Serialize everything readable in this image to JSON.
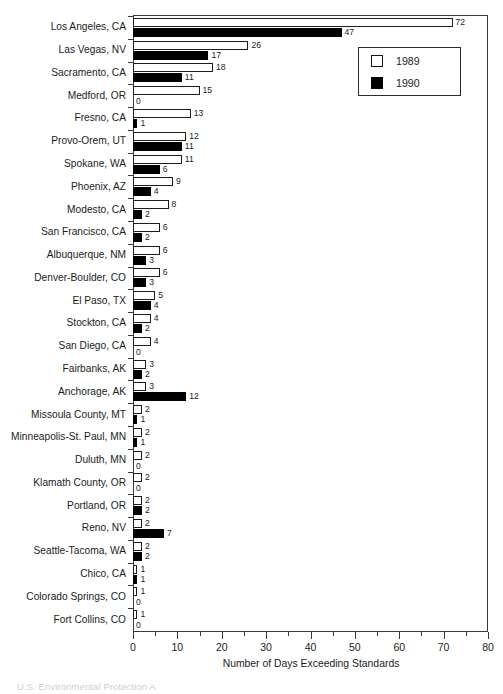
{
  "chart_data": {
    "type": "bar",
    "orientation": "horizontal",
    "title": "",
    "xlabel": "Number of Days Exceeding Standards",
    "ylabel": "",
    "xlim": [
      0,
      80
    ],
    "xticks": [
      0,
      10,
      20,
      30,
      40,
      50,
      60,
      70,
      80
    ],
    "xtick_labels": [
      "0",
      "10",
      "20",
      "30",
      "40",
      "50",
      "60",
      "70",
      "80"
    ],
    "minor_tick_step": 5,
    "grid": false,
    "legend_position": "top-right",
    "categories": [
      "Los Angeles, CA",
      "Las Vegas, NV",
      "Sacramento, CA",
      "Medford, OR",
      "Fresno, CA",
      "Provo-Orem, UT",
      "Spokane, WA",
      "Phoenix, AZ",
      "Modesto, CA",
      "San Francisco, CA",
      "Albuquerque, NM",
      "Denver-Boulder, CO",
      "El Paso, TX",
      "Stockton, CA",
      "San Diego, CA",
      "Fairbanks, AK",
      "Anchorage, AK",
      "Missoula County, MT",
      "Minneapolis-St. Paul, MN",
      "Duluth, MN",
      "Klamath County, OR",
      "Portland, OR",
      "Reno, NV",
      "Seattle-Tacoma, WA",
      "Chico, CA",
      "Colorado Springs, CO",
      "Fort Collins, CO"
    ],
    "series": [
      {
        "name": "1989",
        "style": "open",
        "color": "#ffffff",
        "edge_color": "#1c1c1c",
        "values": [
          72,
          26,
          18,
          15,
          13,
          12,
          11,
          9,
          8,
          6,
          6,
          6,
          5,
          4,
          4,
          3,
          3,
          2,
          2,
          2,
          2,
          2,
          2,
          2,
          1,
          1,
          1
        ]
      },
      {
        "name": "1990",
        "style": "solid",
        "color": "#000000",
        "edge_color": "#000000",
        "values": [
          47,
          17,
          11,
          0,
          1,
          11,
          6,
          4,
          2,
          2,
          3,
          3,
          4,
          2,
          0,
          2,
          12,
          1,
          1,
          0,
          0,
          2,
          7,
          2,
          1,
          0,
          0
        ]
      }
    ]
  },
  "legend": {
    "items": [
      {
        "label": "1989",
        "swatch": "open-square-icon"
      },
      {
        "label": "1990",
        "swatch": "filled-square-icon"
      }
    ]
  },
  "axis": {
    "x_title": "Number of Days Exceeding Standards"
  },
  "caption": {
    "text": "U.S. Environmental Protection A"
  }
}
